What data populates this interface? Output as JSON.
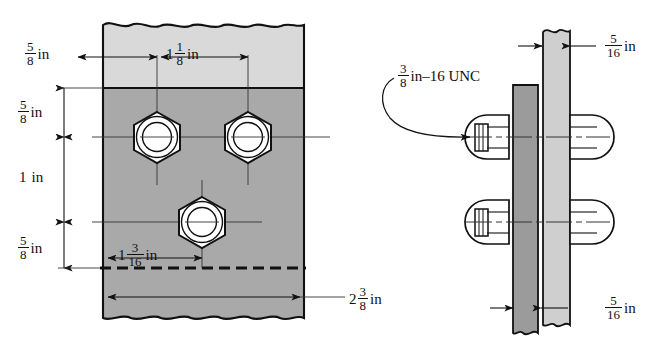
{
  "drawing": {
    "title": "Bolted plate connection detail",
    "colors": {
      "line": "#111111",
      "plate_light": "#d9d9d9",
      "plate_mid": "#a9a9a9",
      "plate_dark": "#9b9b9b",
      "bolt_fill": "#ffffff",
      "background": "#ffffff"
    }
  },
  "front_view": {
    "name": "front-view",
    "dimensions": {
      "edge_distance_left": {
        "whole": "",
        "num": "5",
        "den": "8",
        "unit": "in",
        "text": "5/8 in"
      },
      "bolt_pitch_horizontal": {
        "whole": "1",
        "num": "1",
        "den": "8",
        "unit": "in",
        "text": "1 1/8 in"
      },
      "edge_distance_top": {
        "whole": "",
        "num": "5",
        "den": "8",
        "unit": "in",
        "text": "5/8 in"
      },
      "bolt_pitch_vertical": {
        "whole": "1",
        "num": "",
        "den": "",
        "unit": "in",
        "text": "1 in"
      },
      "edge_distance_bottom": {
        "whole": "",
        "num": "5",
        "den": "8",
        "unit": "in",
        "text": "5/8 in"
      },
      "lower_bolt_offset": {
        "whole": "1",
        "num": "3",
        "den": "16",
        "unit": "in",
        "text": "1 3/16 in"
      },
      "overall_width": {
        "whole": "2",
        "num": "3",
        "den": "8",
        "unit": "in",
        "text": "2 3/8 in"
      }
    },
    "bolts": [
      {
        "name": "bolt-top-left",
        "cx": 157,
        "cy": 137
      },
      {
        "name": "bolt-top-right",
        "cx": 248,
        "cy": 137
      },
      {
        "name": "bolt-bottom-center",
        "cx": 202,
        "cy": 222
      }
    ]
  },
  "side_view": {
    "name": "side-view",
    "thread_callout": {
      "whole": "",
      "num": "3",
      "den": "8",
      "suffix": "in–16 UNC",
      "text": "3/8 in-16 UNC"
    },
    "dimensions": {
      "plate_thickness_top": {
        "whole": "",
        "num": "5",
        "den": "16",
        "unit": "in",
        "text": "5/16 in"
      },
      "plate_thickness_bottom": {
        "whole": "",
        "num": "5",
        "den": "16",
        "unit": "in",
        "text": "5/16 in"
      }
    },
    "fasteners": [
      {
        "name": "bolt-assembly-upper",
        "cy": 137
      },
      {
        "name": "bolt-assembly-lower",
        "cy": 222
      }
    ]
  }
}
